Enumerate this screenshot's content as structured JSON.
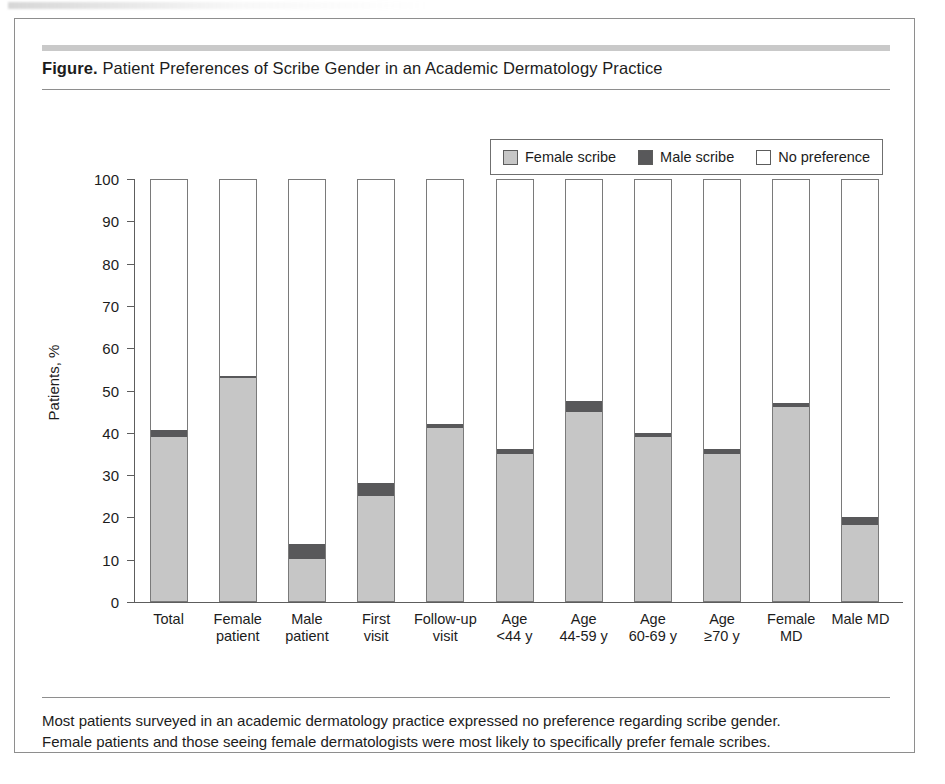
{
  "figure": {
    "label": "Figure.",
    "title": " Patient Preferences of Scribe Gender in an Academic Dermatology Practice",
    "caption_line1": "Most patients surveyed in an academic dermatology practice expressed no preference regarding scribe gender.",
    "caption_line2": "Female patients and those seeing female dermatologists were most likely to specifically prefer female scribes."
  },
  "colors": {
    "female_scribe": "#c6c6c6",
    "male_scribe": "#58585a",
    "no_preference": "#ffffff",
    "axis": "#5d5d5d",
    "bar_outline": "#7a7a7a",
    "rule": "#8e8e8e",
    "title_rule": "#c9c9c9"
  },
  "legend": {
    "items": [
      {
        "label": "Female scribe",
        "swatch": "#c6c6c6",
        "icon": "legend-swatch-icon"
      },
      {
        "label": "Male scribe",
        "swatch": "#58585a",
        "icon": "legend-swatch-icon"
      },
      {
        "label": "No preference",
        "swatch": "#ffffff",
        "icon": "legend-swatch-icon"
      }
    ]
  },
  "chart_data": {
    "type": "bar",
    "subtype": "stacked-vertical-100",
    "title": "Patient Preferences of Scribe Gender in an Academic Dermatology Practice",
    "xlabel": "",
    "ylabel": "Patients, %",
    "ylim": [
      0,
      100
    ],
    "yticks": [
      0,
      10,
      20,
      30,
      40,
      50,
      60,
      70,
      80,
      90,
      100
    ],
    "ytick_labels": [
      "0",
      "10",
      "20",
      "30",
      "40",
      "50",
      "60",
      "70",
      "80",
      "90",
      "100"
    ],
    "grid": false,
    "legend_position": "top-right",
    "categories": [
      "Total",
      "Female patient",
      "Male patient",
      "First visit",
      "Follow-up visit",
      "Age <44 y",
      "Age 44-59 y",
      "Age 60-69 y",
      "Age ≥70 y",
      "Female MD",
      "Male MD"
    ],
    "category_lines": [
      [
        "Total"
      ],
      [
        "Female",
        "patient"
      ],
      [
        "Male",
        "patient"
      ],
      [
        "First",
        "visit"
      ],
      [
        "Follow-up",
        "visit"
      ],
      [
        "Age",
        "<44 y"
      ],
      [
        "Age",
        "44-59 y"
      ],
      [
        "Age",
        "60-69 y"
      ],
      [
        "Age",
        "≥70 y"
      ],
      [
        "Female",
        "MD"
      ],
      [
        "Male MD"
      ]
    ],
    "series": [
      {
        "name": "Female scribe",
        "color": "#c6c6c6",
        "values": [
          39,
          53,
          10,
          25,
          41,
          35,
          45,
          39,
          35,
          46,
          18
        ]
      },
      {
        "name": "Male scribe",
        "color": "#58585a",
        "values": [
          1.5,
          0.5,
          3.5,
          3,
          1,
          1,
          2.5,
          1,
          1,
          1,
          2
        ]
      },
      {
        "name": "No preference",
        "color": "#ffffff",
        "values": [
          59.5,
          46.5,
          86.5,
          72,
          58,
          64,
          52.5,
          60,
          64,
          53,
          80
        ]
      }
    ]
  }
}
